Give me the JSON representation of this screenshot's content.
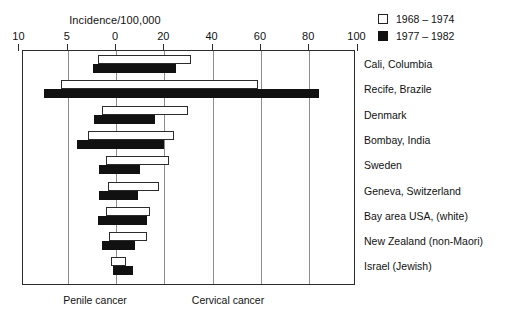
{
  "chart_data": {
    "type": "bar",
    "orientation": "horizontal-diverging",
    "title": "Incidence/100,000",
    "xlabel": "Incidence/100,000",
    "ylabel": "",
    "grid": true,
    "legend_position": "top-right",
    "left_axis_caption": "Penile cancer",
    "right_axis_caption": "Cervical cancer",
    "left_tick_labels": [
      "10",
      "5",
      "0"
    ],
    "right_tick_labels": [
      "20",
      "40",
      "60",
      "80",
      "100"
    ],
    "all_tick_labels": [
      "10",
      "5",
      "0",
      "20",
      "40",
      "60",
      "80",
      "100"
    ],
    "left_axis_range": [
      10,
      0
    ],
    "right_axis_range": [
      0,
      100
    ],
    "categories": [
      "Cali, Columbia",
      "Recife, Brazile",
      "Denmark",
      "Bombay, India",
      "Sweden",
      "Geneva, Switzerland",
      "Bay area USA, (white)",
      "New Zealand (non-Maori)",
      "Israel (Jewish)"
    ],
    "series": [
      {
        "name": "1968 – 1974",
        "style": "open",
        "color": "#ffffff",
        "penile_values": [
          1.9,
          5.7,
          1.4,
          2.9,
          1.0,
          0.8,
          1.0,
          0.7,
          0.5
        ],
        "cervical_values": [
          31,
          59,
          30,
          24,
          22,
          18,
          14,
          13,
          4
        ]
      },
      {
        "name": "1977 – 1982",
        "style": "filled",
        "color": "#111111",
        "penile_values": [
          2.4,
          7.5,
          2.3,
          4.0,
          1.8,
          1.8,
          1.9,
          1.4,
          0.3
        ],
        "cervical_values": [
          25,
          84,
          16,
          20,
          10,
          9,
          13,
          8,
          7
        ]
      }
    ]
  },
  "chart": {
    "axis_title": "Incidence/100,000",
    "bottom_left_caption": "Penile cancer",
    "bottom_right_caption": "Cervical cancer",
    "ticks": [
      {
        "label": "10",
        "value": -10
      },
      {
        "label": "5",
        "value": -5
      },
      {
        "label": "0",
        "value": 0
      },
      {
        "label": "20",
        "value": 20
      },
      {
        "label": "40",
        "value": 40
      },
      {
        "label": "60",
        "value": 60
      },
      {
        "label": "80",
        "value": 80
      },
      {
        "label": "100",
        "value": 100
      }
    ],
    "legend": [
      {
        "label": "1968 – 1974",
        "style": "open"
      },
      {
        "label": "1977 – 1982",
        "style": "filled"
      }
    ],
    "rows": [
      {
        "label": "Cali, Columbia",
        "w_left": 1.9,
        "w_right": 31,
        "b_left": 2.4,
        "b_right": 25
      },
      {
        "label": "Recife, Brazile",
        "w_left": 5.7,
        "w_right": 59,
        "b_left": 7.5,
        "b_right": 84
      },
      {
        "label": "Denmark",
        "w_left": 1.4,
        "w_right": 30,
        "b_left": 2.3,
        "b_right": 16
      },
      {
        "label": "Bombay, India",
        "w_left": 2.9,
        "w_right": 24,
        "b_left": 4.0,
        "b_right": 20
      },
      {
        "label": "Sweden",
        "w_left": 1.0,
        "w_right": 22,
        "b_left": 1.8,
        "b_right": 10
      },
      {
        "label": "Geneva, Switzerland",
        "w_left": 0.8,
        "w_right": 18,
        "b_left": 1.8,
        "b_right": 9
      },
      {
        "label": "Bay area USA, (white)",
        "w_left": 1.0,
        "w_right": 14,
        "b_left": 1.9,
        "b_right": 13
      },
      {
        "label": "New Zealand (non-Maori)",
        "w_left": 0.7,
        "w_right": 13,
        "b_left": 1.4,
        "b_right": 8
      },
      {
        "label": "Israel (Jewish)",
        "w_left": 0.5,
        "w_right": 4,
        "b_left": 0.3,
        "b_right": 7
      }
    ]
  }
}
